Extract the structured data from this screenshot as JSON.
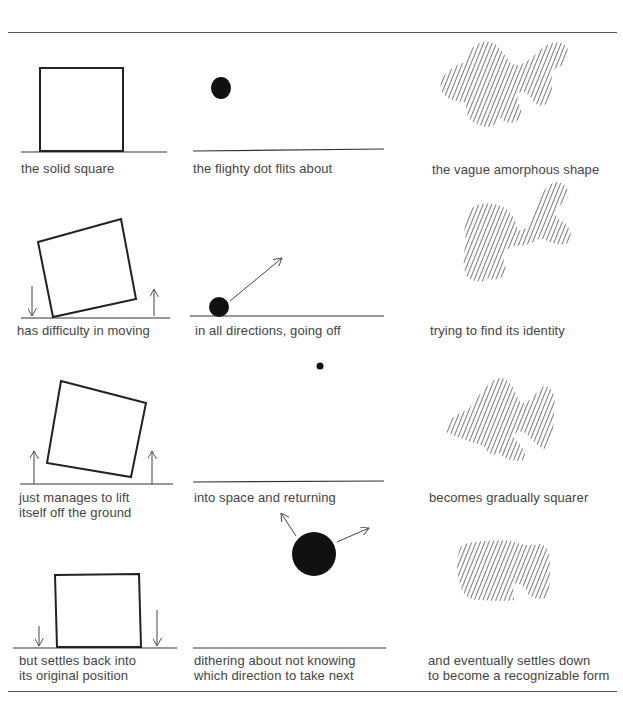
{
  "figure": {
    "columns": [
      {
        "subject": "square",
        "panels": [
          {
            "caption": "the solid square"
          },
          {
            "caption": "has difficulty in moving"
          },
          {
            "caption": "just manages to lift\nitself off the ground"
          },
          {
            "caption": "but settles back into\nits original position"
          }
        ]
      },
      {
        "subject": "dot",
        "panels": [
          {
            "caption": "the flighty dot flits about"
          },
          {
            "caption": "in all directions, going off"
          },
          {
            "caption": "into space and returning"
          },
          {
            "caption": "dithering about not knowing\nwhich direction to take next"
          }
        ]
      },
      {
        "subject": "amorphous-shape",
        "panels": [
          {
            "caption": "the vague amorphous shape"
          },
          {
            "caption": "trying to find its identity"
          },
          {
            "caption": "becomes gradually squarer"
          },
          {
            "caption": "and eventually settles down\nto become a recognizable form"
          }
        ]
      }
    ]
  }
}
